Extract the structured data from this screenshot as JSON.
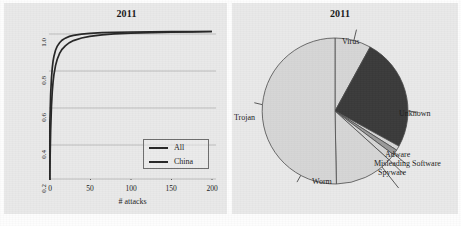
{
  "figure": {
    "background_color": "#e9e9e9",
    "panel_count": 2
  },
  "left_panel": {
    "title": "2011"
  },
  "right_panel": {
    "title": "2011"
  },
  "chart_data": [
    {
      "type": "line",
      "title": "2011",
      "xlabel": "# attacks",
      "ylabel": "% hosts with <= x attacks",
      "xlim": [
        0,
        205
      ],
      "ylim": [
        0.15,
        1.02
      ],
      "xticks": [
        0,
        50,
        100,
        150,
        200
      ],
      "xtick_labels": [
        "0",
        "50",
        "100",
        "150",
        "200"
      ],
      "yticks": [
        0.2,
        0.4,
        0.6,
        0.8,
        1.0
      ],
      "ytick_labels": [
        "0.2",
        "0.4",
        "0.6",
        "0.8",
        "1.0"
      ],
      "grid": "horizontal",
      "legend_position": "lower right",
      "series": [
        {
          "name": "All",
          "color": "#262626",
          "x": [
            1,
            2,
            3,
            4,
            5,
            6,
            8,
            10,
            13,
            16,
            20,
            25,
            30,
            40,
            50,
            65,
            80,
            100,
            125,
            150,
            175,
            200
          ],
          "y": [
            0.47,
            0.64,
            0.73,
            0.79,
            0.83,
            0.857,
            0.893,
            0.915,
            0.936,
            0.95,
            0.962,
            0.972,
            0.978,
            0.985,
            0.989,
            0.993,
            0.995,
            0.997,
            0.998,
            0.999,
            0.999,
            1.0
          ]
        },
        {
          "name": "China",
          "color": "#262626",
          "x": [
            1,
            2,
            3,
            4,
            5,
            6,
            8,
            10,
            13,
            16,
            20,
            25,
            30,
            40,
            50,
            65,
            80,
            100,
            125,
            150,
            175,
            200
          ],
          "y": [
            0.19,
            0.43,
            0.57,
            0.655,
            0.712,
            0.752,
            0.805,
            0.84,
            0.875,
            0.898,
            0.918,
            0.936,
            0.948,
            0.963,
            0.972,
            0.981,
            0.986,
            0.991,
            0.994,
            0.996,
            0.998,
            1.0
          ]
        }
      ]
    },
    {
      "type": "pie",
      "title": "2011",
      "start_angle_deg": 90,
      "direction": "clockwise",
      "labels": [
        "Virus",
        "Unknown",
        "Adware",
        "Misleading Software",
        "Spyware",
        "Worm",
        "Trojan"
      ],
      "values": [
        8.0,
        25.0,
        1.0,
        1.2,
        1.5,
        13.0,
        50.3
      ],
      "colors": [
        "#d6d6d6",
        "#3b3b3b",
        "#d6d6d6",
        "#9a9a9a",
        "#d6d6d6",
        "#d6d6d6",
        "#d6d6d6"
      ],
      "edge_color": "#4a4a4a"
    }
  ],
  "legend": {
    "items": [
      {
        "label": "All"
      },
      {
        "label": "China"
      }
    ]
  },
  "pie_labels": {
    "virus": "Virus",
    "unknown": "Unknown",
    "adware": "Adware",
    "misleading_software": "Misleading Software",
    "spyware": "Spyware",
    "worm": "Worm",
    "trojan": "Trojan"
  }
}
